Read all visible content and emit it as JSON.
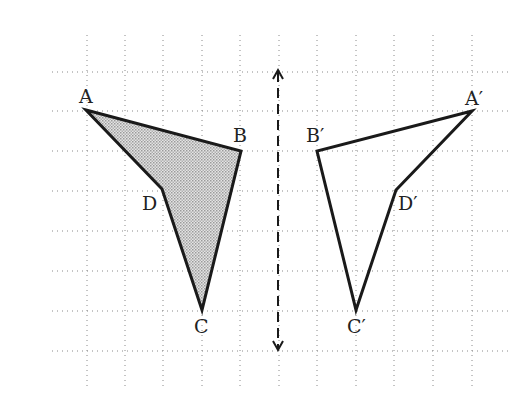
{
  "diagram": {
    "type": "reflection",
    "grid": {
      "columns_x": [
        87,
        125,
        163,
        202,
        240,
        279,
        317,
        356,
        394,
        433,
        472
      ],
      "rows_y": [
        72,
        111,
        151,
        191,
        231,
        271,
        311,
        351
      ],
      "x_extent": [
        52,
        508
      ],
      "y_extent": [
        35,
        388
      ],
      "line_color": "#8a8a8a"
    },
    "line_of_reflection": {
      "x": 278,
      "y_top": 70,
      "y_bottom": 350,
      "style": "dashed-double-arrow",
      "color": "#1a1a1a"
    },
    "original_shape": {
      "name": "ABCD",
      "fill": "#c9c9c9",
      "stroke": "#1a1a1a",
      "vertices": [
        {
          "name": "A",
          "x": 86,
          "y": 110,
          "label": "A",
          "label_x": 79,
          "label_y": 103
        },
        {
          "name": "B",
          "x": 241,
          "y": 151,
          "label": "B",
          "label_x": 233,
          "label_y": 142
        },
        {
          "name": "C",
          "x": 202,
          "y": 310,
          "label": "C",
          "label_x": 194,
          "label_y": 333
        },
        {
          "name": "D",
          "x": 162,
          "y": 189,
          "label": "D",
          "label_x": 142,
          "label_y": 210
        }
      ],
      "path_order": [
        "A",
        "B",
        "C",
        "D"
      ]
    },
    "image_shape": {
      "name": "A′B′C′D′",
      "fill": "none",
      "stroke": "#1a1a1a",
      "vertices": [
        {
          "name": "A′",
          "x": 472,
          "y": 111,
          "label": "A′",
          "label_x": 465,
          "label_y": 105
        },
        {
          "name": "B′",
          "x": 317,
          "y": 151,
          "label": "B′",
          "label_x": 306,
          "label_y": 142
        },
        {
          "name": "C′",
          "x": 356,
          "y": 310,
          "label": "C′",
          "label_x": 347,
          "label_y": 333
        },
        {
          "name": "D′",
          "x": 396,
          "y": 190,
          "label": "D′",
          "label_x": 398,
          "label_y": 210
        }
      ],
      "path_order": [
        "A′",
        "B′",
        "C′",
        "D′"
      ]
    }
  }
}
